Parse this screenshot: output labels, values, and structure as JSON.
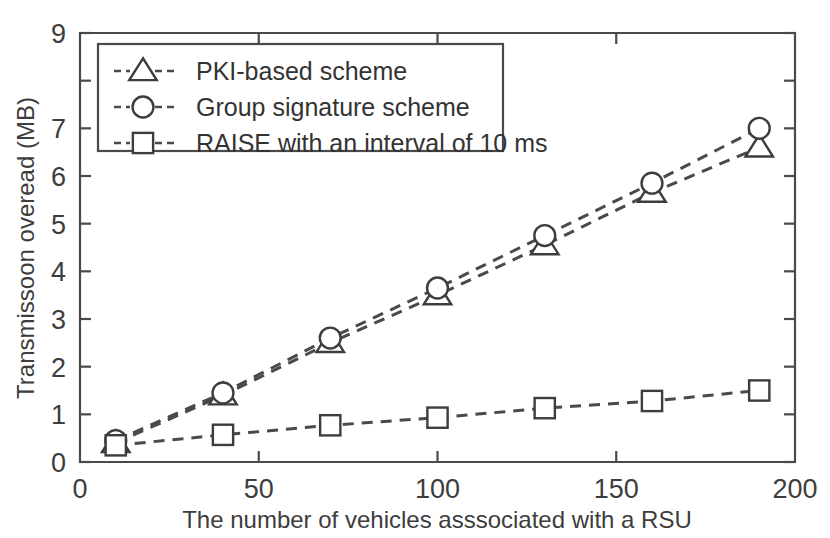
{
  "chart_data": {
    "type": "line",
    "title": "",
    "xlabel": "The number of vehicles asssociated with a RSU",
    "ylabel": "Transmissoon overead (MB)",
    "xlim": [
      0,
      200
    ],
    "ylim": [
      0,
      9
    ],
    "x": [
      10,
      40,
      70,
      100,
      130,
      160,
      190
    ],
    "xticks": [
      0,
      50,
      100,
      150,
      200
    ],
    "xticklabels": [
      "0",
      "50",
      "100",
      "150",
      "200"
    ],
    "yticks": [
      0,
      1,
      2,
      3,
      4,
      5,
      6,
      7,
      8,
      9
    ],
    "yticklabels": [
      "0",
      "1",
      "2",
      "3",
      "4",
      "5",
      "6",
      "7",
      "",
      "9"
    ],
    "grid": false,
    "legend_position": "upper-left",
    "series": [
      {
        "name": "PKI-based scheme",
        "marker": "triangle",
        "linestyle": "dashed",
        "values": [
          0.4,
          1.4,
          2.5,
          3.5,
          4.55,
          5.65,
          6.6
        ]
      },
      {
        "name": "Group signature scheme",
        "marker": "circle",
        "linestyle": "dashed",
        "values": [
          0.45,
          1.45,
          2.6,
          3.65,
          4.75,
          5.85,
          7.0
        ]
      },
      {
        "name": "RAISE with an interval of 10 ms",
        "marker": "square",
        "linestyle": "dashed",
        "values": [
          0.35,
          0.57,
          0.77,
          0.93,
          1.13,
          1.28,
          1.5
        ]
      }
    ],
    "colors": {
      "line": "#4a4a4a",
      "marker_fill": "#ffffff",
      "marker_stroke": "#3d3d3d",
      "text": "#3d3d3d",
      "background": "#ffffff"
    }
  }
}
